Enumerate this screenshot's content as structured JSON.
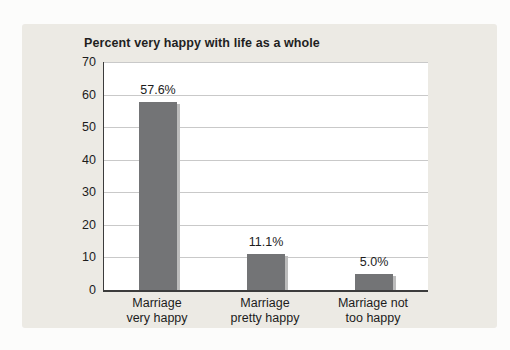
{
  "page": {
    "background": "#fcfcfb"
  },
  "panel": {
    "background": "#eceae4"
  },
  "chart_data": {
    "type": "bar",
    "title": "Percent very happy with life as a whole",
    "categories": [
      "Marriage\nvery happy",
      "Marriage\npretty happy",
      "Marriage not\ntoo happy"
    ],
    "values": [
      57.6,
      11.1,
      5.0
    ],
    "value_labels": [
      "57.6%",
      "11.1%",
      "5.0%"
    ],
    "xlabel": "",
    "ylabel": "",
    "ylim": [
      0,
      70
    ],
    "yticks": [
      0,
      10,
      20,
      30,
      40,
      50,
      60,
      70
    ],
    "grid": "horizontal gridlines at every y tick",
    "legend": "none",
    "bar_color": "#737476",
    "bar_shadow_color": "#bcbcbc",
    "gridline_color": "#c9c9c9",
    "axis_color": "#3c3c3c",
    "text_color": "#1c1c1c",
    "plot_background": "#ffffff"
  }
}
